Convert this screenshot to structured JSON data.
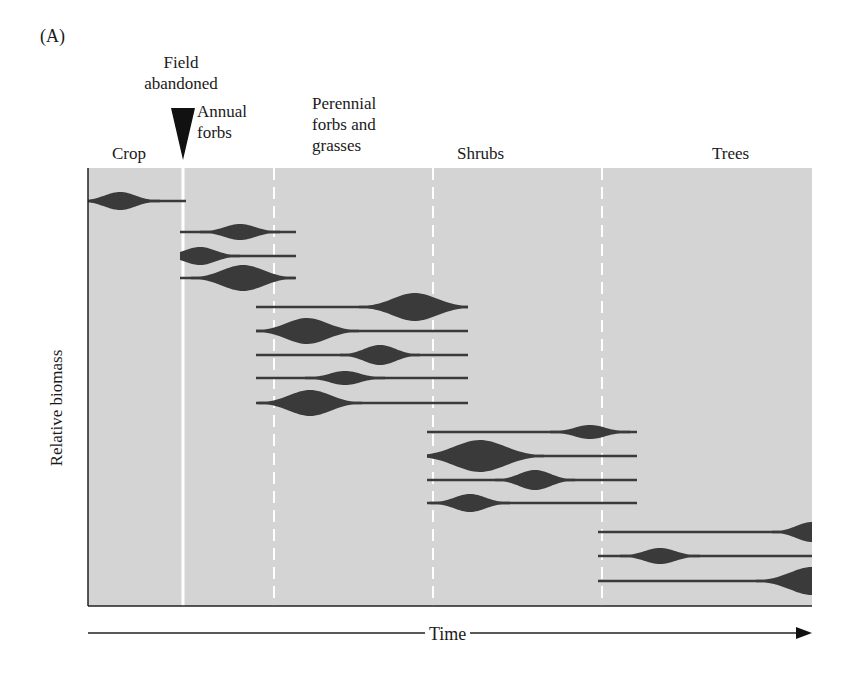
{
  "figure": {
    "panel_label": "(A)",
    "event_label_line1": "Field",
    "event_label_line2": "abandoned",
    "y_axis_label": "Relative biomass",
    "x_axis_label": "Time"
  },
  "stages": [
    {
      "name": "Crop"
    },
    {
      "name": "Annual forbs",
      "line1": "Annual",
      "line2": "forbs"
    },
    {
      "name": "Perennial forbs and grasses",
      "line1": "Perennial",
      "line2": "forbs and",
      "line3": "grasses"
    },
    {
      "name": "Shrubs"
    },
    {
      "name": "Trees"
    }
  ],
  "colors": {
    "plot_background": "#d4d4d4",
    "shape_fill": "#3a3a3a",
    "divider": "#ffffff",
    "text": "#1a1a1a"
  },
  "chart_data": {
    "type": "area",
    "xlabel": "Time",
    "ylabel": "Relative biomass",
    "x_range_px": [
      88,
      812
    ],
    "stage_boundaries_px": [
      {
        "x": 183,
        "style": "solid",
        "meaning": "Field abandoned"
      },
      {
        "x": 274,
        "style": "dashed"
      },
      {
        "x": 433,
        "style": "dashed"
      },
      {
        "x": 602,
        "style": "dashed"
      }
    ],
    "series": [
      {
        "group": "Crop",
        "y": 201,
        "start": 88,
        "end": 186,
        "peak_x": 120,
        "peak_halfwidth": 9
      },
      {
        "group": "Annual forbs",
        "y": 232,
        "start": 180,
        "end": 296,
        "peak_x": 240,
        "peak_halfwidth": 8
      },
      {
        "group": "Annual forbs",
        "y": 256,
        "start": 180,
        "end": 296,
        "peak_x": 200,
        "peak_halfwidth": 9
      },
      {
        "group": "Annual forbs",
        "y": 278,
        "start": 180,
        "end": 296,
        "peak_x": 243,
        "peak_halfwidth": 13
      },
      {
        "group": "Perennial forbs and grasses",
        "y": 307,
        "start": 256,
        "end": 468,
        "peak_x": 415,
        "peak_halfwidth": 14
      },
      {
        "group": "Perennial forbs and grasses",
        "y": 331,
        "start": 256,
        "end": 468,
        "peak_x": 307,
        "peak_halfwidth": 13
      },
      {
        "group": "Perennial forbs and grasses",
        "y": 355,
        "start": 256,
        "end": 468,
        "peak_x": 380,
        "peak_halfwidth": 10
      },
      {
        "group": "Perennial forbs and grasses",
        "y": 378,
        "start": 256,
        "end": 468,
        "peak_x": 345,
        "peak_halfwidth": 7
      },
      {
        "group": "Perennial forbs and grasses",
        "y": 403,
        "start": 256,
        "end": 468,
        "peak_x": 310,
        "peak_halfwidth": 13
      },
      {
        "group": "Shrubs",
        "y": 432,
        "start": 427,
        "end": 637,
        "peak_x": 590,
        "peak_halfwidth": 7
      },
      {
        "group": "Shrubs",
        "y": 456,
        "start": 427,
        "end": 637,
        "peak_x": 480,
        "peak_halfwidth": 16
      },
      {
        "group": "Shrubs",
        "y": 480,
        "start": 427,
        "end": 637,
        "peak_x": 535,
        "peak_halfwidth": 10
      },
      {
        "group": "Shrubs",
        "y": 503,
        "start": 427,
        "end": 637,
        "peak_x": 470,
        "peak_halfwidth": 9
      },
      {
        "group": "Trees",
        "y": 532,
        "start": 598,
        "end": 812,
        "peak_x": 812,
        "peak_halfwidth": 10
      },
      {
        "group": "Trees",
        "y": 556,
        "start": 598,
        "end": 812,
        "peak_x": 660,
        "peak_halfwidth": 8
      },
      {
        "group": "Trees",
        "y": 581,
        "start": 598,
        "end": 812,
        "peak_x": 812,
        "peak_halfwidth": 14
      }
    ],
    "grid": false,
    "legend": "none"
  }
}
